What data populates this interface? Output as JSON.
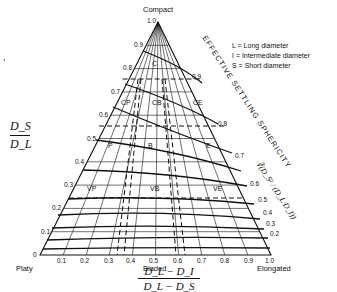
{
  "diagram": {
    "vertices": {
      "top": "Compact",
      "left": "Platy",
      "right": "Elongated",
      "bottom_mid": "Bladed"
    },
    "legend": [
      "L = Long diameter",
      "I = Intermediate diameter",
      "S = Short diameter"
    ],
    "left_axis": {
      "label_num": "D_S",
      "label_den": "D_L",
      "ticks": [
        "0",
        "0.1",
        "0.2",
        "0.3",
        "0.4",
        "0.5",
        "0.6",
        "0.7",
        "0.8",
        "0.9",
        "1.0"
      ]
    },
    "bottom_axis": {
      "label_num": "D_L − D_I",
      "label_den": "D_L − D_S",
      "ticks": [
        "0.1",
        "0.2",
        "0.3",
        "0.4",
        "0.5",
        "0.6",
        "0.7",
        "0.8",
        "0.9",
        "1.0"
      ]
    },
    "right_axis": {
      "title": "EFFECTIVE SETTLING SPHERICITY",
      "formula": "∛(D_S² / (D_L·D_I))",
      "ticks": [
        "0.9",
        "0.8",
        "0.7",
        "0.6",
        "0.5",
        "0.4",
        "0.3",
        "0.2"
      ]
    },
    "regions": [
      "C",
      "CP",
      "CB",
      "CE",
      "P",
      "B",
      "E",
      "VP",
      "VB",
      "VE"
    ],
    "stray_mark": ","
  }
}
